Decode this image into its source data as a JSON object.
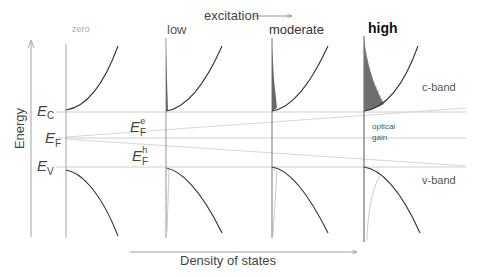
{
  "axes": {
    "y_label": "Energy",
    "x_label": "Density of states"
  },
  "excitation_label": "excitation",
  "panels": [
    {
      "label": "zero",
      "style": "faint"
    },
    {
      "label": "low",
      "style": "normal"
    },
    {
      "label": "moderate",
      "style": "normal"
    },
    {
      "label": "high",
      "style": "bold"
    }
  ],
  "levels": {
    "Ec": {
      "main": "E",
      "sub": "C"
    },
    "EF": {
      "main": "E",
      "sub": "F"
    },
    "Ev": {
      "main": "E",
      "sub": "V"
    },
    "EFe": {
      "main": "E",
      "sub": "F",
      "sup": "e"
    },
    "EFh": {
      "main": "E",
      "sub": "F",
      "sup": "h"
    }
  },
  "annotations": {
    "c_band": "c-band",
    "v_band": "v-band",
    "optical_gain_line1": "optical",
    "optical_gain_line2": "gain"
  },
  "colors": {
    "curve": "#333333",
    "axis": "#888888",
    "level_line": "#c8c8c8",
    "quasi_fermi_line": "#d0d0d0",
    "fill": "#555555",
    "text": "#444444"
  }
}
